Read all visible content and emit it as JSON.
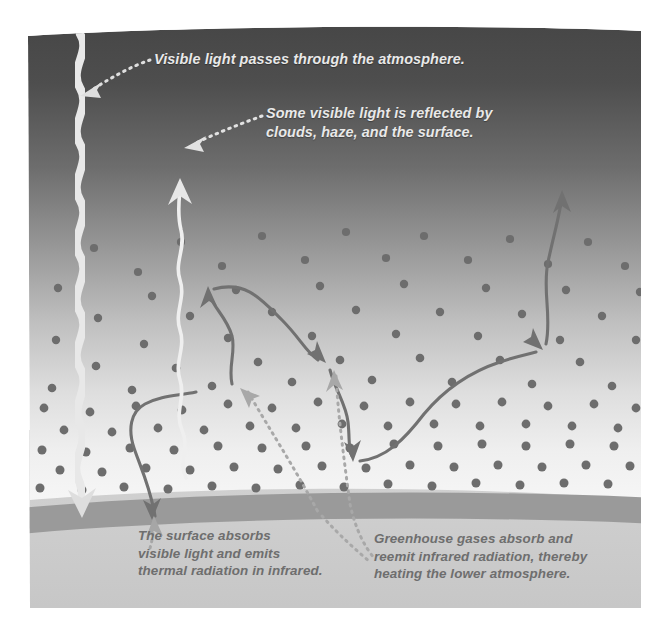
{
  "figure": {
    "type": "diagram",
    "colors": {
      "sky_top": "#464646",
      "sky_bottom": "#f4f4f4",
      "surface_band": "#9a9a9a",
      "ground": "#cfcfcf",
      "molecule_dot": "#6d6d6d",
      "visible_beam": "#e6e6e6",
      "reflected_beam": "#efefef",
      "infrared_arrow": "#717171",
      "leader_dots_light": "#dedede",
      "leader_dots_dark": "#9c9c9c",
      "label_light": "#e9e9e9",
      "label_dark": "#6e6e6e"
    },
    "labels": {
      "visible_light": "Visible light passes through the atmosphere.",
      "reflected_light": "Some visible light is reflected by\nclouds, haze, and the surface.",
      "surface_absorbs": "The surface absorbs\nvisible light and emits\nthermal radiation in infrared.",
      "greenhouse_gases": "Greenhouse gases absorb and\nreemit infrared radiation, thereby\nheating the lower atmosphere."
    },
    "elements": {
      "visible_beam_name": "incoming-visible-light-beam",
      "reflected_beam_name": "reflected-visible-light-beam",
      "infrared_surface_emission": "surface-infrared-emission-arrow",
      "infrared_rebound_down": "infrared-reemission-downward-arrow",
      "infrared_escape": "infrared-escape-to-space-arrow",
      "molecules": "greenhouse-gas-molecules",
      "surface": "earth-surface-band",
      "ground": "ground-layer"
    }
  }
}
